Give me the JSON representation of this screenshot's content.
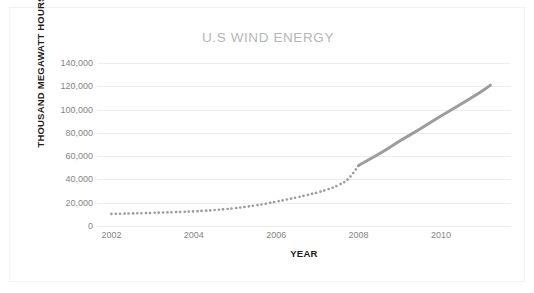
{
  "chart_data": {
    "type": "line",
    "title": "U.S WIND ENERGY",
    "xlabel": "YEAR",
    "ylabel": "THOUSAND MEGAWATT HOURS",
    "xlim": [
      2001.65,
      2011.7
    ],
    "ylim": [
      0,
      140000
    ],
    "grid": true,
    "legend": "none",
    "line_color": "#9d9d9d",
    "grid_color": "#eceded",
    "title_color": "#b6b6b6",
    "tick_label_color": "#848484",
    "axis_title_color": "#1d1d1d",
    "x_ticks": [
      2002,
      2004,
      2006,
      2008,
      2010
    ],
    "x_tick_labels": [
      "2002",
      "2004",
      "2006",
      "2008",
      "2010"
    ],
    "y_ticks": [
      0,
      20000,
      40000,
      60000,
      80000,
      100000,
      120000,
      140000
    ],
    "y_tick_labels": [
      "0",
      "20,000",
      "40,000",
      "60,000",
      "80,000",
      "100,000",
      "120,000",
      "140,000"
    ],
    "series": [
      {
        "name": "U.S Wind Energy",
        "style_note": "dotted until 2008, solid after",
        "dotted_until_x": 2008.0,
        "x": [
          2002.0,
          2002.25,
          2002.5,
          2002.75,
          2003.0,
          2003.25,
          2003.5,
          2003.75,
          2004.0,
          2004.25,
          2004.5,
          2004.75,
          2005.0,
          2005.25,
          2005.5,
          2005.75,
          2006.0,
          2006.25,
          2006.5,
          2006.75,
          2007.0,
          2007.25,
          2007.5,
          2007.75,
          2008.0,
          2008.5,
          2009.0,
          2009.5,
          2010.0,
          2010.5,
          2011.0,
          2011.2
        ],
        "values": [
          10400,
          10600,
          10800,
          11000,
          11300,
          11600,
          11900,
          12200,
          12600,
          13100,
          13700,
          14400,
          15300,
          16400,
          17700,
          19200,
          20900,
          22700,
          24600,
          26600,
          28800,
          31500,
          35000,
          40500,
          52000,
          62000,
          73000,
          83500,
          94500,
          105000,
          116000,
          121000
        ]
      }
    ]
  },
  "title": {
    "text": "U.S WIND ENERGY"
  }
}
